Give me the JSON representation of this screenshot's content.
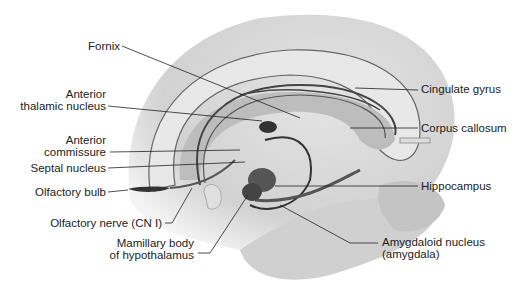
{
  "labels": {
    "fornix": "Fornix",
    "anterior_thalamic_1": "Anterior",
    "anterior_thalamic_2": "thalamic nucleus",
    "anterior_commissure_1": "Anterior",
    "anterior_commissure_2": "commissure",
    "septal_nucleus": "Septal nucleus",
    "olfactory_bulb": "Olfactory bulb",
    "olfactory_nerve": "Olfactory nerve (CN I)",
    "mamillary_1": "Mamillary body",
    "mamillary_2": "of hypothalamus",
    "cingulate_gyrus": "Cingulate gyrus",
    "corpus_callosum": "Corpus callosum",
    "hippocampus": "Hippocampus",
    "amygdaloid_1": "Amygdaloid nucleus",
    "amygdaloid_2": "(amygdala)"
  }
}
